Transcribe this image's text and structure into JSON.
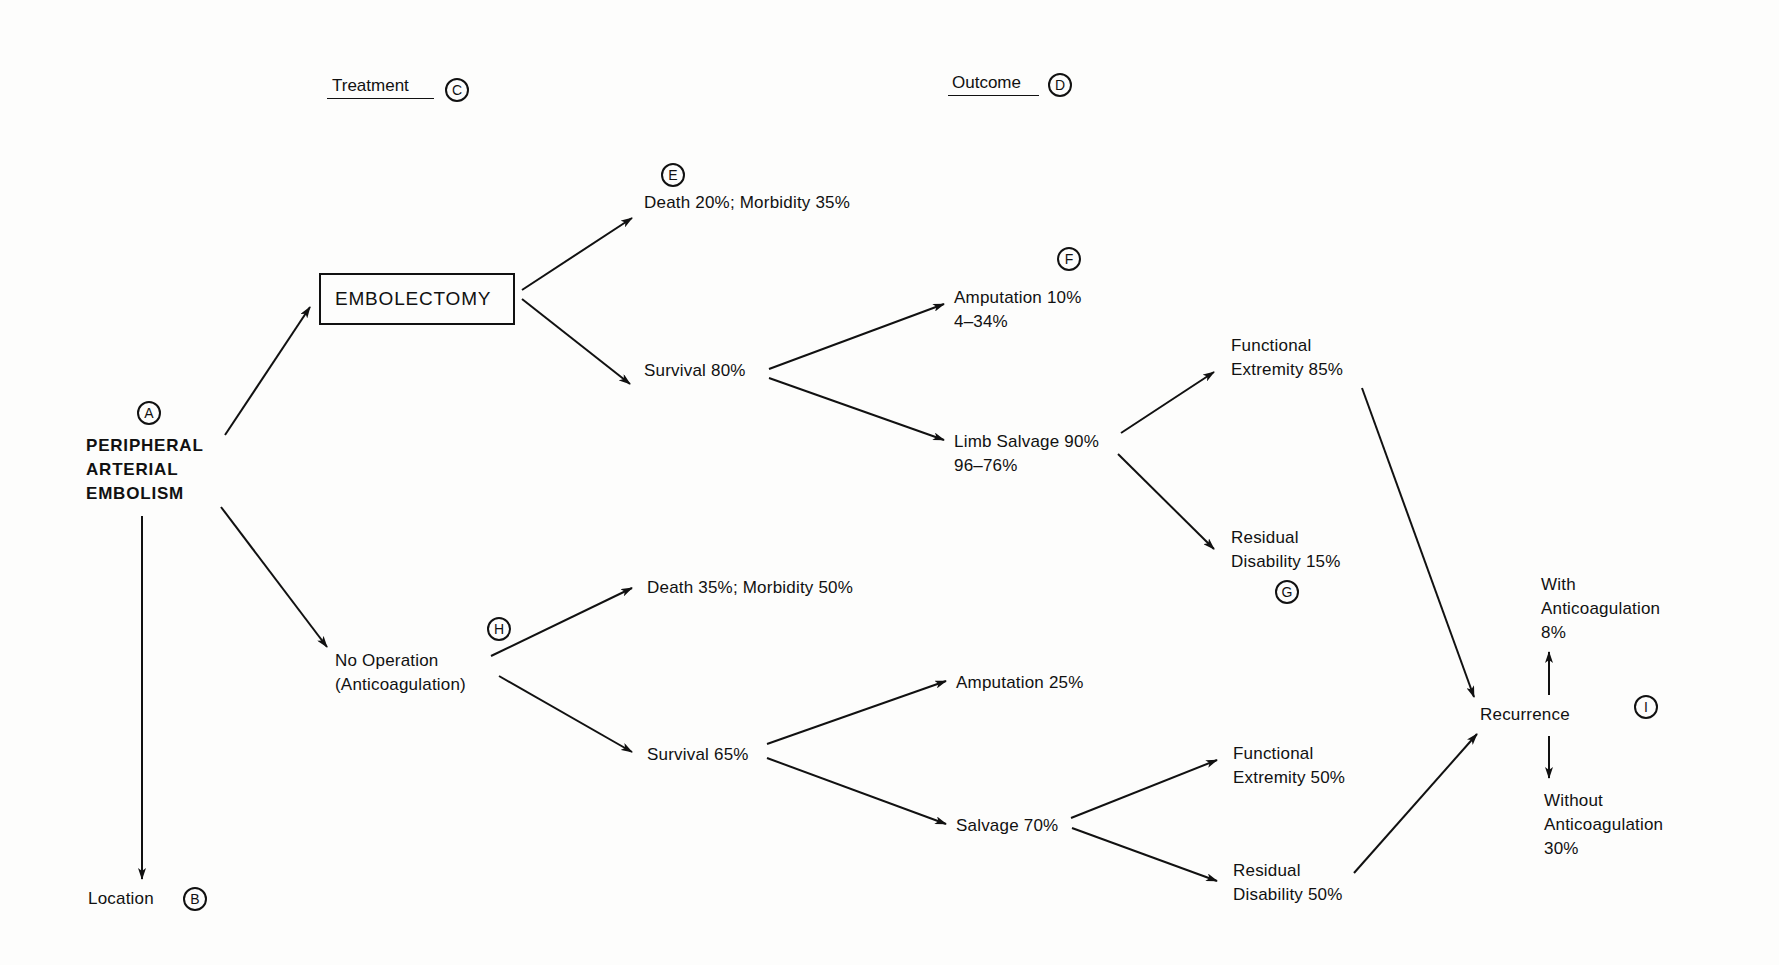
{
  "headers": {
    "treatment": {
      "label": "Treatment",
      "marker": "C"
    },
    "outcome": {
      "label": "Outcome",
      "marker": "D"
    }
  },
  "root": {
    "marker": "A",
    "lines": [
      "PERIPHERAL",
      "ARTERIAL",
      "EMBOLISM"
    ]
  },
  "location": {
    "label": "Location",
    "marker": "B"
  },
  "treatments": {
    "embolectomy": {
      "label": "EMBOLECTOMY"
    },
    "no_operation": {
      "marker": "H",
      "lines": [
        "No Operation",
        "(Anticoagulation)"
      ]
    }
  },
  "embolectomy_branch": {
    "death": {
      "marker": "E",
      "label": "Death 20%; Morbidity 35%"
    },
    "survival": {
      "label": "Survival 80%"
    },
    "amputation": {
      "marker": "F",
      "lines": [
        "Amputation 10%",
        "4–34%"
      ]
    },
    "limb_salvage": {
      "lines": [
        "Limb Salvage 90%",
        "96–76%"
      ]
    },
    "functional": {
      "lines": [
        "Functional",
        "Extremity 85%"
      ]
    },
    "residual": {
      "marker": "G",
      "lines": [
        "Residual",
        "Disability 15%"
      ]
    }
  },
  "no_operation_branch": {
    "death": {
      "label": "Death 35%; Morbidity 50%"
    },
    "survival": {
      "label": "Survival 65%"
    },
    "amputation": {
      "label": "Amputation 25%"
    },
    "salvage": {
      "label": "Salvage 70%"
    },
    "functional": {
      "lines": [
        "Functional",
        "Extremity 50%"
      ]
    },
    "residual": {
      "lines": [
        "Residual",
        "Disability 50%"
      ]
    }
  },
  "recurrence": {
    "label": "Recurrence",
    "marker": "I",
    "with": {
      "lines": [
        "With",
        "Anticoagulation",
        "8%"
      ]
    },
    "without": {
      "lines": [
        "Without",
        "Anticoagulation",
        "30%"
      ]
    }
  },
  "colors": {
    "ink": "#111111",
    "paper": "#fdfdfc"
  }
}
